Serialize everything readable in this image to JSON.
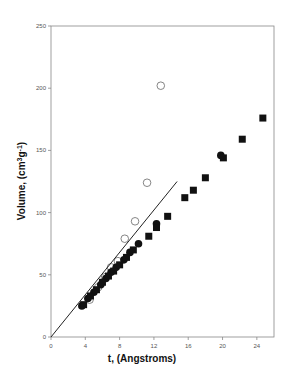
{
  "chart_data": {
    "type": "scatter",
    "title": "",
    "xlabel": "t, (Angstroms)",
    "ylabel": "Volume, (cm3g-1)",
    "ylabel_parts": {
      "main": "Volume, (cm",
      "sup1": "3",
      "mid": "g",
      "sup2": "-1",
      "end": ")"
    },
    "xlim": [
      0,
      26
    ],
    "ylim": [
      0,
      250
    ],
    "xticks": [
      0,
      4,
      8,
      12,
      16,
      20,
      24
    ],
    "yticks": [
      0,
      50,
      100,
      150,
      200,
      250
    ],
    "grid": false,
    "legend": null,
    "series": [
      {
        "name": "open-circles",
        "marker": "circle-open",
        "x": [
          4.5,
          5.5,
          6.3,
          7.0,
          7.8,
          8.6,
          9.8,
          11.2,
          12.8
        ],
        "y": [
          30,
          40,
          48,
          56,
          61,
          79,
          93,
          124,
          202
        ]
      },
      {
        "name": "filled-circles",
        "marker": "circle-filled",
        "x": [
          3.6,
          4.3,
          5.0,
          5.8,
          6.4,
          7.0,
          7.6,
          8.5,
          9.2,
          10.2,
          12.3,
          19.8
        ],
        "y": [
          25,
          31,
          36,
          42,
          47,
          52,
          56,
          62,
          68,
          75,
          91,
          146
        ]
      },
      {
        "name": "filled-squares",
        "marker": "square-filled",
        "x": [
          3.8,
          4.6,
          5.3,
          6.0,
          6.7,
          7.3,
          8.0,
          8.8,
          9.6,
          11.4,
          12.3,
          13.6,
          15.6,
          16.6,
          18.0,
          20.1,
          22.3,
          24.7
        ],
        "y": [
          26,
          33,
          38,
          44,
          49,
          53,
          58,
          64,
          70,
          81,
          88,
          97,
          112,
          118,
          128,
          144,
          159,
          176
        ]
      },
      {
        "name": "reference-line",
        "marker": "line",
        "x": [
          0,
          14.7
        ],
        "y": [
          0,
          125
        ]
      }
    ]
  },
  "colors": {
    "axis": "#888888",
    "marker_fill": "#111111",
    "open_marker_stroke": "#777777",
    "line": "#222222"
  }
}
